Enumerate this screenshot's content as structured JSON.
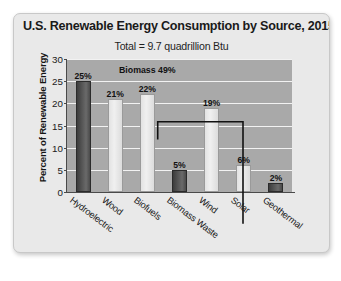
{
  "chart_data": {
    "type": "bar",
    "title": "U.S. Renewable Energy Consumption by Source, 2015",
    "subtitle": "Total = 9.7 quadrillion Btu",
    "xlabel": "",
    "ylabel": "Percent of Renewable Energy",
    "ylim": [
      0,
      30
    ],
    "yticks": [
      0,
      5,
      10,
      15,
      20,
      25,
      30
    ],
    "ytick_labels": [
      "0",
      "5",
      "10",
      "15",
      "20",
      "25",
      "30"
    ],
    "grid": true,
    "legend": "none",
    "categories": [
      "Hydroelectric",
      "Wood",
      "Biofuels",
      "Biomass Waste",
      "Wind",
      "Solar",
      "Geothermal"
    ],
    "values": [
      25,
      21,
      22,
      5,
      19,
      6,
      2
    ],
    "value_labels": [
      "25%",
      "21%",
      "22%",
      "5%",
      "19%",
      "6%",
      "2%"
    ],
    "bar_shades": [
      "dark",
      "light",
      "light",
      "dark",
      "light",
      "light",
      "dark"
    ],
    "annotations": [
      {
        "name": "biomass-bracket",
        "label": "Biomass 49%",
        "spans_categories": [
          "Wood",
          "Biofuels",
          "Biomass Waste"
        ],
        "value": 49
      }
    ]
  },
  "colors": {
    "card_background": "#e9e9e9",
    "plot_background": "#a9a9a9",
    "gridline": "#f2f2f2",
    "bar_dark": "#555555",
    "bar_light": "#e8e8e8",
    "text": "#1a1a1a",
    "axis": "#4a4a4a"
  }
}
